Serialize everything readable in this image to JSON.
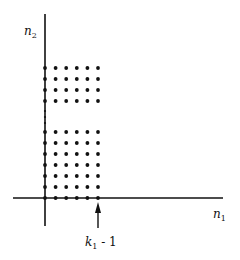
{
  "diagram": {
    "axes": {
      "x_label": "n",
      "x_label_sub": "1",
      "y_label": "n",
      "y_label_sub": "2",
      "color": "#111111"
    },
    "marker": {
      "label_var": "k",
      "label_sub": "1",
      "label_rest": " - 1",
      "arrow": "up-arrow"
    },
    "grid": {
      "columns": 6,
      "upper_rows": 4,
      "lower_rows": 7,
      "ellipsis": "vertical-dots",
      "dot_color": "#111111"
    }
  }
}
